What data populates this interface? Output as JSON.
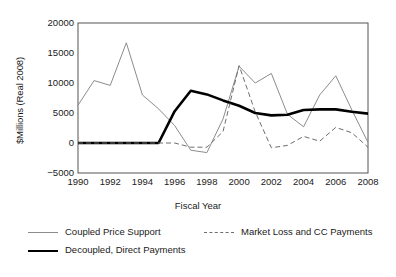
{
  "chart_data": {
    "type": "line",
    "title": "",
    "xlabel": "Fiscal Year",
    "ylabel": "$Millions (Real 2008)",
    "xlim": [
      1990,
      2008
    ],
    "ylim": [
      -5000,
      20000
    ],
    "grid": false,
    "legend_position": "below",
    "x": [
      1990,
      1991,
      1992,
      1993,
      1994,
      1995,
      1996,
      1997,
      1998,
      1999,
      2000,
      2001,
      2002,
      2003,
      2004,
      2005,
      2006,
      2007,
      2008
    ],
    "xticks": [
      "1990",
      "1992",
      "1994",
      "1996",
      "1998",
      "2000",
      "2002",
      "2004",
      "2006",
      "2008"
    ],
    "xtick_values": [
      1990,
      1992,
      1994,
      1996,
      1998,
      2000,
      2002,
      2004,
      2006,
      2008
    ],
    "yticks": [
      "-5000",
      "0",
      "5000",
      "10000",
      "15000",
      "20000"
    ],
    "ytick_values": [
      -5000,
      0,
      5000,
      10000,
      15000,
      20000
    ],
    "series": [
      {
        "name": "Coupled Price Support",
        "style": "solid-thin",
        "color": "#8c8c8c",
        "values": [
          6300,
          10400,
          9600,
          16700,
          8000,
          5700,
          2900,
          -1200,
          -1600,
          4000,
          12800,
          10000,
          11600,
          4800,
          2700,
          8000,
          11200,
          5500,
          100
        ]
      },
      {
        "name": "Decoupled, Direct Payments",
        "style": "solid-thick",
        "color": "#000000",
        "values": [
          0,
          0,
          0,
          0,
          0,
          0,
          5300,
          8700,
          8100,
          7100,
          6200,
          5000,
          4600,
          4700,
          5500,
          5600,
          5600,
          5200,
          4900
        ]
      },
      {
        "name": "Market Loss and CC Payments",
        "style": "dashed",
        "color": "#6e6e6e",
        "values": [
          0,
          0,
          0,
          0,
          0,
          0,
          0,
          -700,
          -700,
          1900,
          12900,
          5200,
          -800,
          -400,
          1100,
          300,
          2600,
          1700,
          -700
        ]
      }
    ]
  },
  "legend": {
    "items": [
      {
        "label": "Coupled Price Support"
      },
      {
        "label": "Market Loss and CC Payments"
      },
      {
        "label": "Decoupled, Direct Payments"
      }
    ]
  }
}
